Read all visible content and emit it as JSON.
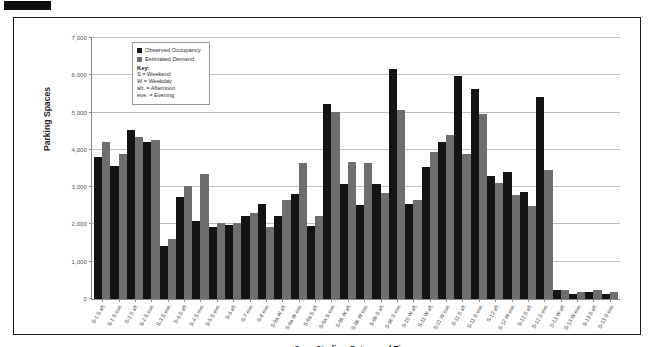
{
  "figure": {
    "redaction_mark": "",
    "axis_title_x": "Case Studies, Dates, and Times",
    "axis_title_y": "Parking Spaces"
  },
  "legend": {
    "series": [
      {
        "label": "Observed Occupancy",
        "color": "#141414"
      },
      {
        "label": "Estimated Demand",
        "color": "#6e6e6e"
      }
    ],
    "key_title": "Key:",
    "key_lines": [
      "S = Weekend",
      "W = Weekday",
      "aft. = Afternoon",
      "eve. = Evening"
    ]
  },
  "chart_data": {
    "type": "bar",
    "title": "",
    "subtitle": "",
    "xlabel": "Case Studies, Dates, and Times",
    "ylabel": "Parking Spaces",
    "ylim": [
      0,
      7000
    ],
    "ytick_labels": [
      "0",
      "1,000",
      "2,000",
      "3,000",
      "4,000",
      "5,000",
      "6,000",
      "7,000"
    ],
    "ytick_values": [
      0,
      1000,
      2000,
      3000,
      4000,
      5000,
      6000,
      7000
    ],
    "grid": true,
    "legend_position": "inside-top-left",
    "categories": [
      "S-1 S aft.",
      "S-1 S eve.",
      "S-2 S aft.",
      "S-2 S eve.",
      "S-3 S eve.",
      "S-4 S aft.",
      "S-4 S eve.",
      "S-5 S eve.",
      "S-6 aft.",
      "S-7 eve.",
      "S-8 eve.",
      "S-9a W aft.",
      "S-9a W eve.",
      "S-9a S aft.",
      "S-9a S eve.",
      "S-9b W aft.",
      "S-9b W eve.",
      "S-9b S aft.",
      "S-9b S eve.",
      "S-10 W aft.",
      "S-11 W aft.",
      "S-11 W eve.",
      "S-11 S aft.",
      "S-11 S eve.",
      "S-12 aft.",
      "S-12 W eve.",
      "S-12 S aft.",
      "S-12 S eve.",
      "S-13 W aft.",
      "S-13 W eve.",
      "S-13 S aft.",
      "S-13 S eve."
    ],
    "series": [
      {
        "name": "Observed Occupancy",
        "color": "#141414",
        "values": [
          3820,
          3580,
          4520,
          4210,
          1430,
          2730,
          2090,
          1940,
          1990,
          2220,
          2540,
          2230,
          2810,
          1950,
          5240,
          3090,
          2510,
          3080,
          6180,
          2560,
          3530,
          4210,
          5980,
          5640,
          3310,
          3410,
          2870,
          5420,
          240,
          140,
          200,
          130
        ]
      },
      {
        "name": "Estimated Demand",
        "color": "#6e6e6e",
        "values": [
          4220,
          3900,
          4350,
          4260,
          1610,
          3020,
          3350,
          2050,
          2050,
          2300,
          1930,
          2650,
          3640,
          2230,
          5020,
          3680,
          3660,
          2830,
          5080,
          2660,
          3940,
          4410,
          3900,
          4950,
          3100,
          2800,
          2490,
          3460,
          230,
          180,
          250,
          190
        ]
      }
    ]
  }
}
